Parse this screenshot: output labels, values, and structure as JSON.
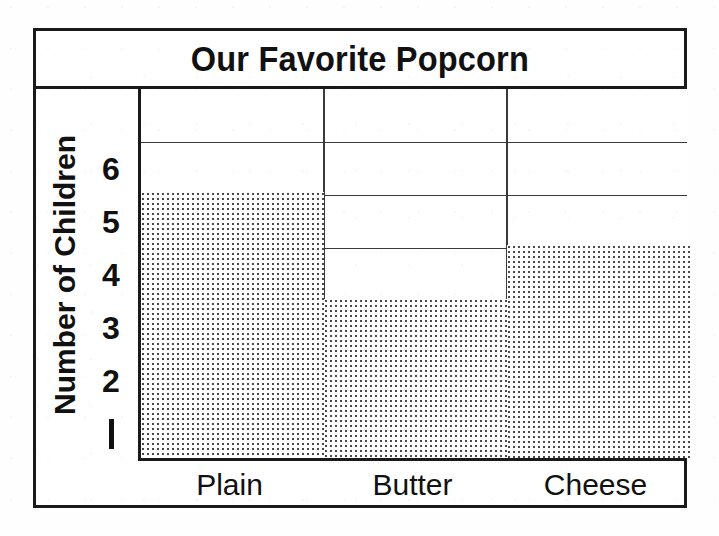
{
  "chart_data": {
    "type": "bar",
    "title": "Our Favorite Popcorn",
    "xlabel": "",
    "ylabel": "Number of Children",
    "categories": [
      "Plain",
      "Butter",
      "Cheese"
    ],
    "values": [
      5,
      3,
      4
    ],
    "ylim": [
      0,
      7
    ],
    "y_ticks": [
      "6",
      "5",
      "4",
      "3",
      "2",
      "1"
    ],
    "y_tick_values": [
      6,
      5,
      4,
      3,
      2,
      1
    ],
    "grid": true,
    "legend": "none",
    "orientation": "vertical",
    "bar_fill": "stipple-dots",
    "colors": {
      "ink": "#1a1a1a",
      "grid": "#3a3a3a",
      "bar_dots": "#4a4a4a",
      "background": "#ffffff"
    }
  },
  "axis": {
    "y_title": "Number of Children"
  }
}
